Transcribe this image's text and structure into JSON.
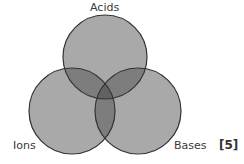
{
  "diagram": {
    "type": "venn",
    "sets": [
      {
        "label": "Acids"
      },
      {
        "label": "Ions"
      },
      {
        "label": "Bases"
      }
    ],
    "marks": "[5]",
    "colors": {
      "fill": "#a8a8a8",
      "stroke": "#3a3a3a",
      "overlap": "#7c7c7c",
      "center": "#5e5e5e"
    }
  }
}
